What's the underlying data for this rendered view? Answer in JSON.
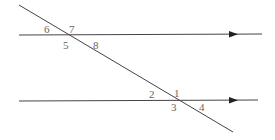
{
  "diagram": {
    "lines": [
      {
        "id": "top-parallel",
        "x1": 19,
        "y1": 35,
        "x2": 262,
        "y2": 34,
        "arrow_x": 233
      },
      {
        "id": "bottom-parallel",
        "x1": 19,
        "y1": 101,
        "x2": 258,
        "y2": 100,
        "arrow_x": 233
      },
      {
        "id": "transversal",
        "x1": 19,
        "y1": 5,
        "x2": 233,
        "y2": 132
      }
    ],
    "angles": [
      {
        "label": "6",
        "x": 44,
        "y": 33
      },
      {
        "label": "7",
        "x": 69,
        "y": 33
      },
      {
        "label": "5",
        "x": 63,
        "y": 49
      },
      {
        "label": "8",
        "x": 93,
        "y": 49
      },
      {
        "label": "2",
        "x": 149,
        "y": 98
      },
      {
        "label": "1",
        "x": 174,
        "y": 97
      },
      {
        "label": "3",
        "x": 171,
        "y": 111
      },
      {
        "label": "4",
        "x": 199,
        "y": 111
      }
    ],
    "colors": {
      "line": "#444444",
      "label": "#666666"
    }
  }
}
